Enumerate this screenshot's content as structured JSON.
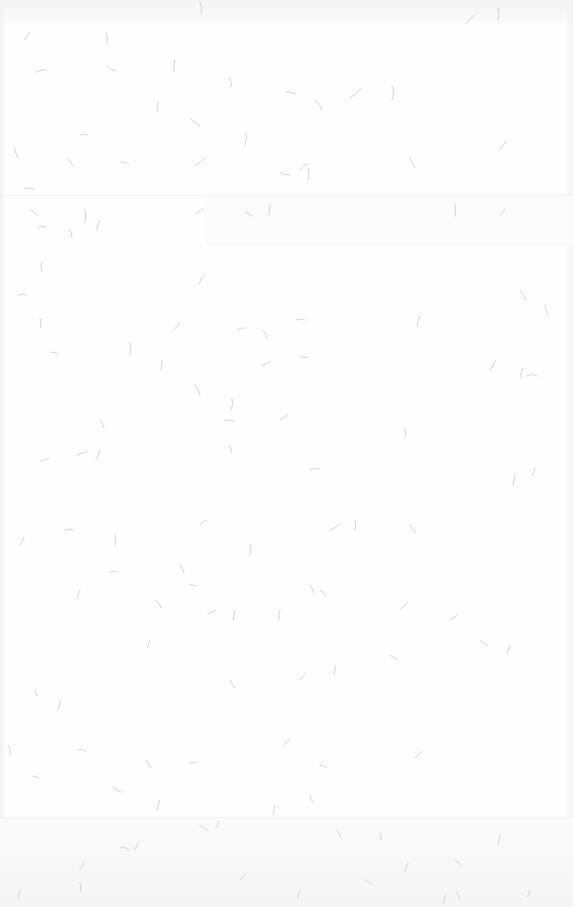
{
  "page": {
    "background_color": "#fefefe",
    "texture": "paper-fibers",
    "fiber_color": "#c9c9c9"
  },
  "header": {
    "title": ""
  }
}
